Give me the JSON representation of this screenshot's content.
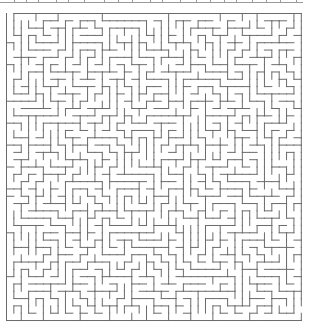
{
  "maze": {
    "cols": 40,
    "rows": 42,
    "origin_x": 6.5,
    "origin_y": 13.5,
    "cell_w": 7.37,
    "cell_h": 7.31,
    "wall_color": "#6b6b6b",
    "wall_width": 1,
    "seed": 20240,
    "entrance": {
      "side": "top",
      "col": 0
    },
    "exit": {
      "side": "right",
      "row": 40
    }
  },
  "top_strip": {
    "y": 2.5,
    "color": "#9a9a9a",
    "ticks_x": [
      14,
      26,
      38,
      56,
      68,
      84,
      104,
      118,
      132,
      150,
      162,
      180,
      196,
      210,
      224,
      236,
      252,
      266,
      280,
      296
    ]
  }
}
